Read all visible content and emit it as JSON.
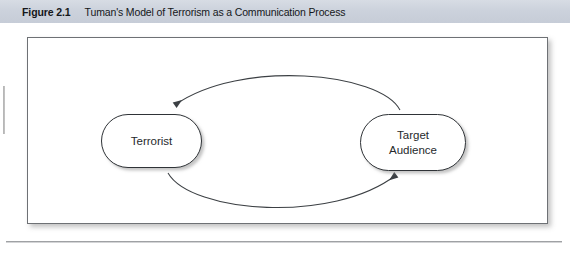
{
  "figure": {
    "label": "Figure 2.1",
    "title": "Tuman's Model of Terrorism as a Communication Process"
  },
  "diagram": {
    "nodes": [
      {
        "id": "terrorist",
        "label": "Terrorist"
      },
      {
        "id": "target-audience",
        "line1": "Target",
        "line2": "Audience"
      }
    ],
    "connectors": [
      {
        "id": "audience-to-terrorist",
        "direction": "right-to-left",
        "shape": "curve-above",
        "arrowhead": "terrorist"
      },
      {
        "id": "terrorist-to-audience",
        "direction": "left-to-right",
        "shape": "curve-below",
        "arrowhead": "target-audience"
      }
    ]
  },
  "colors": {
    "header_band": "#ccd2dc",
    "frame_border": "#6e7175",
    "node_border": "#2f3337",
    "text": "#15171a",
    "connector": "#3c4044"
  }
}
